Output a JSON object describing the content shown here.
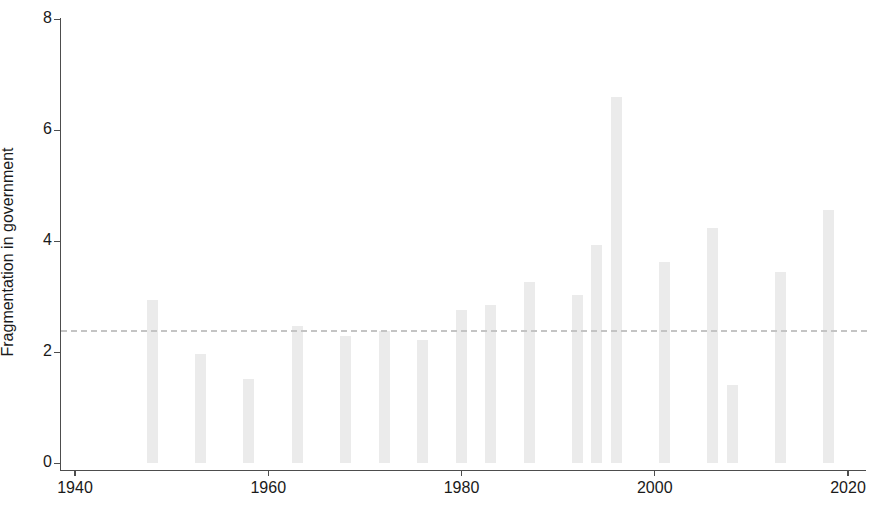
{
  "chart_data": {
    "type": "bar",
    "title": "",
    "subtitle": "",
    "xlabel": "",
    "ylabel": "Fragmentation in government",
    "xlim": [
      1940,
      2020
    ],
    "ylim": [
      0,
      8
    ],
    "xticks": [
      1940,
      1960,
      1980,
      2000,
      2020
    ],
    "yticks": [
      0,
      2,
      4,
      6,
      8
    ],
    "grid": false,
    "legend": null,
    "bar_color": "#ebebeb",
    "axis_color": "#4d4d4d",
    "reference_line": {
      "value": 2.4,
      "style": "dashed",
      "color": "#c4c4c4",
      "label": ""
    },
    "x": [
      1948,
      1953,
      1958,
      1963,
      1968,
      1972,
      1976,
      1980,
      1983,
      1987,
      1992,
      1994,
      1996,
      2001,
      2006,
      2008,
      2013,
      2018
    ],
    "categories": [
      "1948",
      "1953",
      "1958",
      "1963",
      "1968",
      "1972",
      "1976",
      "1980",
      "1983",
      "1987",
      "1992",
      "1994",
      "1996",
      "2001",
      "2006",
      "2008",
      "2013",
      "2018"
    ],
    "values": [
      2.93,
      1.96,
      1.52,
      2.47,
      2.29,
      2.37,
      2.22,
      2.75,
      2.84,
      3.26,
      3.02,
      3.93,
      6.6,
      3.62,
      4.24,
      1.41,
      3.45,
      4.55
    ]
  },
  "axes": {
    "ytick_labels": [
      "0",
      "2",
      "4",
      "6",
      "8"
    ],
    "xtick_labels": [
      "1940",
      "1960",
      "1980",
      "2000",
      "2020"
    ],
    "ylabel_text": "Fragmentation in government"
  }
}
